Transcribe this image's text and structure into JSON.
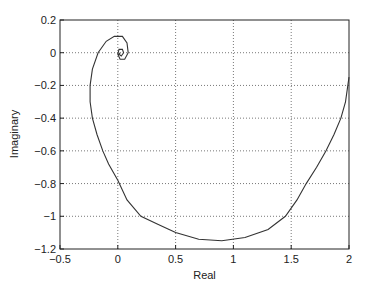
{
  "chart_data": {
    "type": "line",
    "title": "",
    "xlabel": "Real",
    "ylabel": "Imaginary",
    "xlim": [
      -0.5,
      2
    ],
    "ylim": [
      -1.2,
      0.2
    ],
    "xticks": [
      -0.5,
      0,
      0.5,
      1,
      1.5,
      2
    ],
    "xtick_labels": [
      "-0.5",
      "0",
      "0.5",
      "1",
      "1.5",
      "2"
    ],
    "yticks": [
      0.2,
      0,
      -0.2,
      -0.4,
      -0.6,
      -0.8,
      -1,
      -1.2
    ],
    "ytick_labels": [
      "0.2",
      "0",
      "-0.2",
      "-0.4",
      "-0.6",
      "-0.8",
      "-1",
      "-1.2"
    ],
    "grid": true,
    "legend": null,
    "series": [
      {
        "name": "Nyquist curve",
        "color": "#333333",
        "points": [
          [
            2.0,
            -0.15
          ],
          [
            1.97,
            -0.3
          ],
          [
            1.93,
            -0.4
          ],
          [
            1.87,
            -0.5
          ],
          [
            1.8,
            -0.6
          ],
          [
            1.72,
            -0.7
          ],
          [
            1.63,
            -0.8
          ],
          [
            1.55,
            -0.9
          ],
          [
            1.45,
            -1.0
          ],
          [
            1.3,
            -1.08
          ],
          [
            1.1,
            -1.13
          ],
          [
            0.9,
            -1.15
          ],
          [
            0.7,
            -1.14
          ],
          [
            0.5,
            -1.1
          ],
          [
            0.35,
            -1.05
          ],
          [
            0.2,
            -1.0
          ],
          [
            0.08,
            -0.9
          ],
          [
            0.0,
            -0.78
          ],
          [
            -0.08,
            -0.68
          ],
          [
            -0.13,
            -0.6
          ],
          [
            -0.18,
            -0.5
          ],
          [
            -0.22,
            -0.4
          ],
          [
            -0.24,
            -0.3
          ],
          [
            -0.24,
            -0.2
          ],
          [
            -0.22,
            -0.1
          ],
          [
            -0.17,
            0.0
          ],
          [
            -0.1,
            0.07
          ],
          [
            -0.03,
            0.1
          ],
          [
            0.04,
            0.1
          ],
          [
            0.08,
            0.06
          ],
          [
            0.09,
            0.0
          ],
          [
            0.06,
            -0.04
          ],
          [
            0.02,
            -0.04
          ],
          [
            0.0,
            -0.01
          ],
          [
            0.01,
            0.02
          ],
          [
            0.04,
            0.02
          ],
          [
            0.05,
            0.0
          ],
          [
            0.03,
            -0.02
          ],
          [
            0.01,
            -0.01
          ],
          [
            0.02,
            0.0
          ]
        ]
      }
    ]
  }
}
